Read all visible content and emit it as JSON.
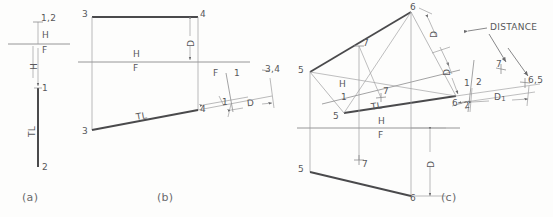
{
  "figure": {
    "background_color": "#fdfdfc",
    "line_color": "#8b8b8d",
    "heavy_line_color": "#4a4a4c",
    "text_color": "#58585a"
  },
  "panels": [
    {
      "id": "a",
      "label": "(a)"
    },
    {
      "id": "b",
      "label": "(b)"
    },
    {
      "id": "c",
      "label": "(c)"
    }
  ],
  "panel_a": {
    "point_top": "1,2",
    "fold_h": "H",
    "fold_f": "F",
    "dim_h": "H",
    "point_1": "1",
    "point_2": "2",
    "true_length": "TL"
  },
  "panel_b": {
    "top_left": "3",
    "top_right": "4",
    "fold_h": "H",
    "fold_f": "F",
    "dim_d": "D",
    "front_left": "3",
    "front_right": "4",
    "true_length": "TL",
    "aux_fold_f": "F",
    "aux_fold_1": "1",
    "aux_tick_1": "1",
    "aux_point": "3,4",
    "aux_dim_d": "D"
  },
  "panel_c": {
    "top_point_6": "6",
    "top_point_5_left": "5",
    "top_point_5_lower": "5",
    "top_point_7_upper": "7",
    "top_point_7_lower": "7",
    "fold_h1_h": "H",
    "fold_h1_1": "1",
    "fold_hf_h": "H",
    "fold_hf_f": "F",
    "fold_12_1": "1",
    "fold_12_2": "2",
    "tick_2": "2",
    "aux_point_6": "6",
    "aux_point_7": "7",
    "aux_point_65": "6,5",
    "true_length": "TL",
    "dim_d_upper": "D",
    "dim_d_lower": "D",
    "dim_d1": "D",
    "dim_d1_sub": "1",
    "dim_d_front": "D",
    "front_point_5": "5",
    "front_point_6": "6",
    "front_point_7": "7",
    "distance_label": "DISTANCE"
  }
}
